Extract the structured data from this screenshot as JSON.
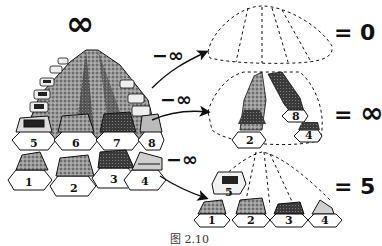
{
  "figure": {
    "title_symbol": "∞",
    "caption": "图 2.10",
    "pile": {
      "description": "Infinite pile of numbered stones",
      "visible_stone_numbers": [
        "1",
        "2",
        "3",
        "4",
        "5",
        "6",
        "7",
        "8"
      ]
    },
    "operations": [
      {
        "label": "−∞",
        "result_prefix": "=",
        "result": "0",
        "description": "All stones removed"
      },
      {
        "label": "−∞",
        "result_prefix": "=",
        "result": "∞",
        "description": "Every other stone removed",
        "remaining_visible_numbers": [
          "2",
          "4",
          "8"
        ]
      },
      {
        "label": "−∞",
        "result_prefix": "=",
        "result": "5",
        "description": "All but first five stones removed",
        "remaining_visible_numbers": [
          "1",
          "2",
          "3",
          "4",
          "5"
        ]
      }
    ]
  }
}
